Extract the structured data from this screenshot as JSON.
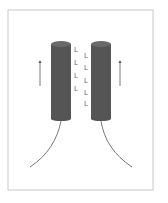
{
  "diagram": {
    "colors": {
      "cylinder": "#555555",
      "cylinder_top": "#6a6a6a",
      "frame": "#c8c8c8",
      "line": "#555555",
      "marker": "#777777"
    },
    "markers_left": [
      "L",
      "L",
      "L",
      "L"
    ],
    "markers_right": [
      "L",
      "L",
      "L",
      "L",
      "L"
    ]
  }
}
